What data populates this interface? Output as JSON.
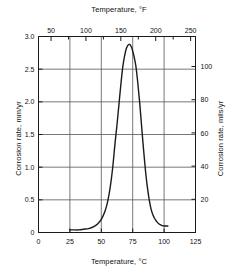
{
  "chart_data": {
    "type": "line",
    "title": "",
    "xlabel": "Temperature, °C",
    "xlabel_top": "Temperature, °F",
    "ylabel": "Corrosion rate, mm/yr",
    "ylabel_right": "Corrosion rate, mils/yr",
    "xlim": [
      0,
      125
    ],
    "ylim": [
      0,
      3.0
    ],
    "xlim_top": [
      32,
      257
    ],
    "ylim_right": [
      0,
      118.1
    ],
    "grid": true,
    "legend": null,
    "xticks": [
      0,
      25,
      50,
      75,
      100,
      125
    ],
    "xticklabels": [
      "0",
      "25",
      "50",
      "75",
      "100",
      "125"
    ],
    "xticks_top": [
      50,
      100,
      150,
      200,
      250
    ],
    "xticklabels_top": [
      "50",
      "100",
      "150",
      "200",
      "250"
    ],
    "xticks_top_minor": [
      75,
      125,
      175,
      225
    ],
    "yticks": [
      0,
      0.5,
      1.0,
      1.5,
      2.0,
      2.5,
      3.0
    ],
    "yticklabels": [
      "0",
      "0.5",
      "1.0",
      "1.5",
      "2.0",
      "2.5",
      "3.0"
    ],
    "yticks_right": [
      20,
      40,
      60,
      80,
      100
    ],
    "yticklabels_right": [
      "20",
      "40",
      "60",
      "80",
      "100"
    ],
    "series": [
      {
        "name": "Corrosion rate",
        "color": "#1a1a1a",
        "x": [
          25,
          28,
          32,
          36,
          40,
          44,
          47,
          50,
          53,
          55,
          57,
          59,
          61,
          62.5,
          64,
          65.5,
          67,
          68.5,
          70,
          72,
          74,
          76,
          77.5,
          79,
          80.5,
          82,
          83.5,
          85,
          86.5,
          88,
          90,
          92,
          94,
          96,
          98,
          100,
          103
        ],
        "y": [
          0.04,
          0.04,
          0.04,
          0.05,
          0.06,
          0.09,
          0.13,
          0.2,
          0.33,
          0.47,
          0.68,
          0.98,
          1.38,
          1.65,
          1.95,
          2.25,
          2.52,
          2.7,
          2.82,
          2.88,
          2.84,
          2.7,
          2.55,
          2.3,
          2.0,
          1.65,
          1.3,
          0.98,
          0.72,
          0.52,
          0.33,
          0.23,
          0.17,
          0.13,
          0.11,
          0.1,
          0.1
        ]
      }
    ]
  },
  "axes": {
    "top_title": "Temperature, °F",
    "bottom_title": "Temperature, °C",
    "left_title": "Corrosion rate, mm/yr",
    "right_title": "Corrosion rate, mils/yr"
  }
}
